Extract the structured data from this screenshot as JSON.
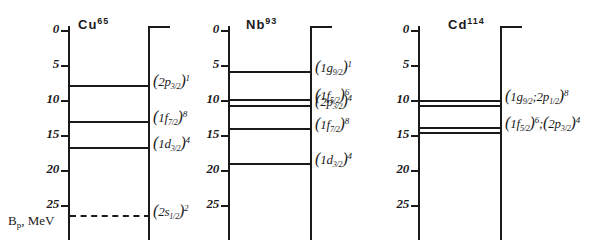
{
  "figure": {
    "type": "nuclear-shell-level-diagram",
    "axis_caption_main": "B",
    "axis_caption_sub": "p",
    "axis_caption_unit": ", MeV",
    "axis_ticks": [
      "0",
      "5",
      "10",
      "15",
      "20",
      "25"
    ],
    "axis_min": 0,
    "axis_max": 25
  },
  "panels": [
    {
      "id": "cu65",
      "nuclide_symbol": "Cu",
      "nuclide_mass": "65",
      "levels": [
        {
          "energy": 7.8,
          "style": "solid",
          "orbital_open": "(",
          "orbital_n": "2",
          "orbital_l": "p",
          "orbital_j": "3/2",
          "orbital_close": ")",
          "occupancy": "1"
        },
        {
          "energy": 13.0,
          "style": "solid",
          "orbital_open": "(",
          "orbital_n": "1",
          "orbital_l": "f",
          "orbital_j": "7/2",
          "orbital_close": ")",
          "occupancy": "8"
        },
        {
          "energy": 16.7,
          "style": "solid",
          "orbital_open": "(",
          "orbital_n": "1",
          "orbital_l": "d",
          "orbital_j": "3/2",
          "orbital_close": ")",
          "occupancy": "4"
        },
        {
          "energy": 26.4,
          "style": "dashed",
          "orbital_open": "(",
          "orbital_n": "2",
          "orbital_l": "s",
          "orbital_j": "1/2",
          "orbital_close": ")",
          "occupancy": "2"
        }
      ]
    },
    {
      "id": "nb93",
      "nuclide_symbol": "Nb",
      "nuclide_mass": "93",
      "levels": [
        {
          "energy": 5.9,
          "style": "solid",
          "orbital_open": "(",
          "orbital_n": "1",
          "orbital_l": "g",
          "orbital_j": "9/2",
          "orbital_close": ")",
          "occupancy": "1"
        },
        {
          "energy": 9.9,
          "style": "solid",
          "orbital_open": "(",
          "orbital_n": "1",
          "orbital_l": "f",
          "orbital_j": "5/2",
          "orbital_close": ")",
          "occupancy": "6"
        },
        {
          "energy": 10.7,
          "style": "solid",
          "orbital_open": "(",
          "orbital_n": "2",
          "orbital_l": "p",
          "orbital_j": "3/2",
          "orbital_close": ")",
          "occupancy": "4"
        },
        {
          "energy": 14.0,
          "style": "solid",
          "orbital_open": "(",
          "orbital_n": "1",
          "orbital_l": "f",
          "orbital_j": "7/2",
          "orbital_close": ")",
          "occupancy": "8"
        },
        {
          "energy": 19.0,
          "style": "solid",
          "orbital_open": "(",
          "orbital_n": "1",
          "orbital_l": "d",
          "orbital_j": "3/2",
          "orbital_close": ")",
          "occupancy": "4"
        }
      ]
    },
    {
      "id": "cd114",
      "nuclide_symbol": "Cd",
      "nuclide_mass": "114",
      "levels": [
        {
          "energy": 10.0,
          "style": "solid",
          "orbital_open": "(",
          "orbital_n": "1",
          "orbital_l": "g",
          "orbital_j": "9/2",
          "orbital_sep": ";",
          "orbital_n2": "2",
          "orbital_l2": "p",
          "orbital_j2": "1/2",
          "orbital_close": ")",
          "occupancy": "8"
        },
        {
          "energy": 10.7,
          "style": "solid"
        },
        {
          "energy": 13.9,
          "style": "solid",
          "orbital_open": "(",
          "orbital_n": "1",
          "orbital_l": "f",
          "orbital_j": "5/2",
          "orbital_close": ")",
          "occupancy": "6",
          "orbital_sep": ";",
          "orbital_open2": "(",
          "orbital_n2": "2",
          "orbital_l2": "p",
          "orbital_j2": "3/2",
          "orbital_close2": ")",
          "occupancy2": "4"
        },
        {
          "energy": 14.6,
          "style": "solid"
        }
      ]
    }
  ],
  "chart_data": {
    "type": "line",
    "xlabel": "",
    "ylabel": "B_p, MeV",
    "ylim": [
      0,
      28
    ],
    "grid": false,
    "legend": "none",
    "categories": [
      "Cu65",
      "Nb93",
      "Cd114"
    ],
    "series": [
      {
        "name": "Cu65",
        "points": [
          {
            "label": "(2p_3/2)^1",
            "value": 7.8
          },
          {
            "label": "(1f_7/2)^8",
            "value": 13.0
          },
          {
            "label": "(1d_3/2)^4",
            "value": 16.7
          },
          {
            "label": "(2s_1/2)^2",
            "value": 26.4
          }
        ]
      },
      {
        "name": "Nb93",
        "points": [
          {
            "label": "(1g_9/2)^1",
            "value": 5.9
          },
          {
            "label": "(1f_5/2)^6",
            "value": 9.9
          },
          {
            "label": "(2p_3/2)^4",
            "value": 10.7
          },
          {
            "label": "(1f_7/2)^8",
            "value": 14.0
          },
          {
            "label": "(1d_3/2)^4",
            "value": 19.0
          }
        ]
      },
      {
        "name": "Cd114",
        "points": [
          {
            "label": "(1g_9/2;2p_1/2)^8",
            "value": 10.0
          },
          {
            "label": "(1g_9/2;2p_1/2)^8",
            "value": 10.7
          },
          {
            "label": "(1f_5/2)^6;(2p_3/2)^4",
            "value": 13.9
          },
          {
            "label": "(1f_5/2)^6;(2p_3/2)^4",
            "value": 14.6
          }
        ]
      }
    ]
  }
}
